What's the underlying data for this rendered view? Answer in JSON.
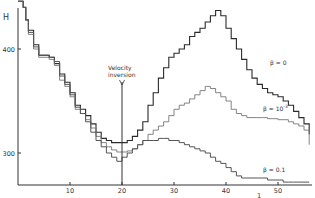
{
  "chart_data": {
    "type": "line",
    "step": true,
    "title": "",
    "xlabel": "",
    "ylabel": "H",
    "xlim": [
      0,
      56
    ],
    "ylim": [
      270,
      448
    ],
    "grid": false,
    "legend": "inline labels",
    "x_ticks": [
      10,
      20,
      30,
      40,
      50
    ],
    "x_tick_labels": [
      "10",
      "20",
      "30",
      "40",
      "50"
    ],
    "y_ticks": [
      300,
      400
    ],
    "y_tick_labels": [
      "300",
      "400"
    ],
    "annotations": [
      {
        "text_lines": [
          "Velocity",
          "inversion"
        ],
        "x": 20,
        "type": "vertical-line-arrow"
      },
      {
        "text": "1",
        "x": 43,
        "position": "below-axis"
      }
    ],
    "series": [
      {
        "name": "β=0",
        "label": "β = 0",
        "color": "#2a2a2a",
        "width": 1.1,
        "x": [
          0,
          1,
          1.5,
          2,
          3,
          4,
          6,
          7,
          8,
          9,
          10,
          11,
          12,
          13,
          14,
          15,
          16,
          17,
          18,
          19,
          20,
          21,
          22,
          23,
          24,
          25,
          26,
          27,
          28,
          29,
          30,
          31,
          32,
          33,
          34,
          35,
          36,
          37,
          38,
          39,
          40,
          41,
          42,
          43,
          44,
          45,
          46,
          47,
          48,
          49,
          50,
          51,
          52,
          53,
          54,
          55,
          56
        ],
        "y": [
          446,
          440,
          428,
          418,
          404,
          394,
          392,
          386,
          376,
          368,
          358,
          346,
          342,
          336,
          328,
          320,
          314,
          312,
          310,
          310,
          310,
          312,
          316,
          322,
          330,
          346,
          358,
          372,
          382,
          392,
          396,
          400,
          404,
          412,
          416,
          420,
          426,
          432,
          437,
          432,
          420,
          410,
          400,
          390,
          380,
          372,
          366,
          362,
          358,
          356,
          354,
          350,
          346,
          340,
          334,
          328,
          318
        ]
      },
      {
        "name": "β=10^-3",
        "label": "β = 10⁻³",
        "color": "#777777",
        "width": 0.9,
        "x": [
          0,
          1,
          1.5,
          2,
          3,
          4,
          6,
          7,
          8,
          9,
          10,
          11,
          12,
          13,
          14,
          15,
          16,
          17,
          18,
          19,
          20,
          21,
          22,
          23,
          24,
          25,
          26,
          27,
          28,
          29,
          30,
          31,
          32,
          33,
          34,
          35,
          36,
          37,
          38,
          39,
          40,
          41,
          42,
          43,
          44,
          45,
          46,
          47,
          48,
          49,
          50,
          51,
          52,
          53,
          54,
          55,
          56
        ],
        "y": [
          446,
          440,
          428,
          414,
          400,
          392,
          390,
          384,
          370,
          364,
          354,
          342,
          338,
          332,
          324,
          316,
          310,
          306,
          303,
          301,
          301,
          302,
          304,
          308,
          312,
          318,
          322,
          326,
          330,
          336,
          342,
          346,
          348,
          352,
          356,
          360,
          364,
          362,
          358,
          354,
          350,
          342,
          338,
          336,
          334,
          334,
          334,
          334,
          333,
          333,
          332,
          332,
          330,
          328,
          326,
          322,
          308
        ]
      },
      {
        "name": "β=0.1",
        "label": "β = 0.1",
        "color": "#555555",
        "width": 1.0,
        "x": [
          0,
          1,
          1.5,
          2,
          3,
          4,
          6,
          7,
          8,
          9,
          10,
          11,
          12,
          13,
          14,
          15,
          16,
          17,
          18,
          19,
          20,
          21,
          22,
          23,
          24,
          25,
          26,
          27,
          28,
          29,
          30,
          31,
          32,
          33,
          34,
          35,
          36,
          37,
          38,
          39,
          40,
          41,
          42,
          43,
          44,
          45,
          46,
          47,
          48,
          49,
          50,
          51,
          52,
          53,
          54,
          55,
          56
        ],
        "y": [
          446,
          440,
          428,
          416,
          402,
          394,
          392,
          388,
          374,
          366,
          356,
          344,
          338,
          330,
          320,
          312,
          306,
          300,
          296,
          292,
          296,
          300,
          304,
          308,
          312,
          312,
          312,
          314,
          314,
          312,
          312,
          310,
          308,
          306,
          304,
          302,
          300,
          296,
          292,
          290,
          286,
          282,
          278,
          276,
          276,
          276,
          276,
          276,
          274,
          274,
          274,
          272,
          272,
          272,
          272,
          272,
          272
        ]
      }
    ]
  },
  "labels": {
    "y_axis": "H",
    "velocity_line1": "Velocity",
    "velocity_line2": "inversion",
    "beta0": "β = 0",
    "beta_mid": "β = 10",
    "beta_mid_exp": "-3",
    "beta01": "β = 0.1",
    "axis_note": "1"
  }
}
